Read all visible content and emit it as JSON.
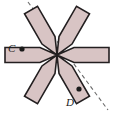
{
  "figure": {
    "type": "rotational-symmetry-diagram",
    "canvas": {
      "width": 117,
      "height": 113,
      "background": "#ffffff"
    },
    "center": {
      "x": 57,
      "y": 55
    },
    "shape": {
      "name": "pinwheel-hexagonal-star",
      "fill_color": "#d8c4c4",
      "stroke_color": "#231f20",
      "stroke_width": 1.6,
      "arm_count": 6,
      "arm_angles_deg": [
        0,
        60,
        120,
        180,
        240,
        300
      ],
      "arm_length": 52,
      "arm_half_width": 7.5,
      "notch_depth": 17
    },
    "dashed_line": {
      "name": "axis-of-symmetry",
      "color": "#6b6b6b",
      "dash": "4 3",
      "width": 1.1,
      "from": {
        "x": 28,
        "y": 2
      },
      "to": {
        "x": 108,
        "y": 110
      }
    },
    "points": [
      {
        "id": "C",
        "label": "C",
        "dot": {
          "x": 22,
          "y": 49,
          "r": 2.6
        },
        "label_pos": {
          "x": 8,
          "y": 52
        },
        "dot_color": "#1a1a1a"
      },
      {
        "id": "D",
        "label": "D",
        "dot": {
          "x": 79,
          "y": 89,
          "r": 2.6
        },
        "label_pos": {
          "x": 66,
          "y": 106
        },
        "dot_color": "#1a1a1a"
      }
    ]
  }
}
